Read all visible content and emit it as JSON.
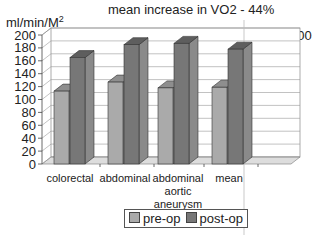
{
  "chart_data": {
    "type": "bar",
    "title": "mean increase in VO2 - 44%",
    "ylabel": "ml/min/M2",
    "ylabel_text": "ml/min/M",
    "ylabel_sup": "2",
    "xlabel": "",
    "annotation": "n = 200",
    "ylim": [
      0,
      200
    ],
    "yticks": [
      "0",
      "20",
      "40",
      "60",
      "80",
      "100",
      "120",
      "140",
      "160",
      "180",
      "200"
    ],
    "categories": [
      "colorectal",
      "abdominal",
      "abdominal aortic aneurysm",
      "mean"
    ],
    "category_lines": [
      [
        "colorectal"
      ],
      [
        "abdominal"
      ],
      [
        "abdominal",
        "aortic",
        "aneurysm"
      ],
      [
        "mean"
      ]
    ],
    "series": [
      {
        "name": "pre-op",
        "color": "#aaaaaa",
        "values": [
          113,
          127,
          118,
          119
        ]
      },
      {
        "name": "post-op",
        "color": "#777777",
        "values": [
          165,
          185,
          187,
          178
        ]
      }
    ],
    "grid": true,
    "legend_position": "bottom",
    "style": "3d-bar"
  }
}
